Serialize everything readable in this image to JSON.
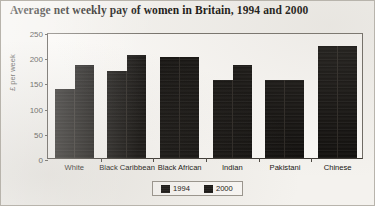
{
  "chart_data": {
    "type": "bar",
    "title": "Average net weekly pay of women in Britain, 1994 and 2000",
    "xlabel": "",
    "ylabel": "£ per week",
    "categories": [
      "White",
      "Black Caribbean",
      "Black African",
      "Indian",
      "Pakistani",
      "Chinese"
    ],
    "series": [
      {
        "name": "1994",
        "values": [
          137,
          172,
          200,
          155,
          155,
          222
        ]
      },
      {
        "name": "2000",
        "values": [
          185,
          205,
          200,
          185,
          155,
          222
        ]
      }
    ],
    "ylim": [
      0,
      250
    ],
    "yticks": [
      0,
      50,
      100,
      150,
      200,
      250
    ],
    "ytick_labels": [
      "0",
      "50",
      "100",
      "150",
      "200",
      "250"
    ],
    "grid": false,
    "legend_position": "bottom-center",
    "bar_color": "#0d0b09"
  }
}
